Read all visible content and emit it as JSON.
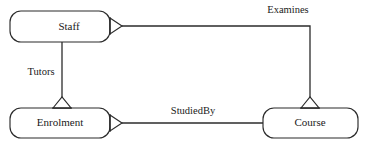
{
  "diagram": {
    "type": "entity-relationship-diagram",
    "notation": "crows-foot",
    "background_color": "#ffffff",
    "line_color": "#2b2b2b",
    "text_color": "#1a1a1a",
    "entities": [
      {
        "id": "staff",
        "label": "Staff"
      },
      {
        "id": "enrolment",
        "label": "Enrolment"
      },
      {
        "id": "course",
        "label": "Course"
      }
    ],
    "relationships": [
      {
        "id": "examines",
        "label": "Examines",
        "from": "staff",
        "to": "course"
      },
      {
        "id": "tutors",
        "label": "Tutors",
        "from": "staff",
        "to": "enrolment"
      },
      {
        "id": "studiedby",
        "label": "StudiedBy",
        "from": "enrolment",
        "to": "course"
      }
    ]
  }
}
